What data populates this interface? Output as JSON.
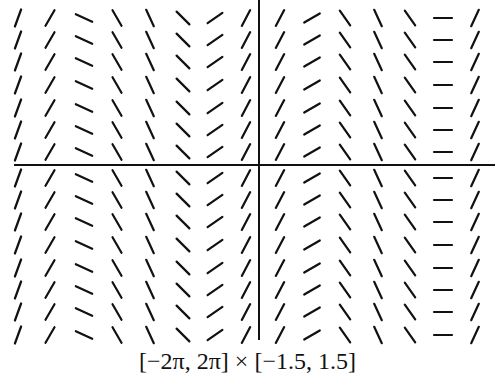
{
  "chart_data": {
    "type": "slope_field",
    "title": "",
    "caption": "[−2π, 2π] × [−1.5, 1.5]",
    "xlim": [
      -6.2832,
      6.2832
    ],
    "ylim": [
      -1.5,
      1.5
    ],
    "xlabel": "",
    "ylabel": "",
    "grid": false,
    "axes": {
      "x_axis_y": 0,
      "y_axis_x": 0
    },
    "note": "Slopes depend only on x (each column identical)",
    "columns_px": [
      18,
      50,
      84,
      117,
      150,
      183,
      215,
      246,
      280,
      312,
      345,
      378,
      410,
      443,
      475
    ],
    "rows_px": [
      18,
      40,
      62,
      85,
      108,
      130,
      152,
      178,
      200,
      222,
      245,
      268,
      290,
      312,
      335
    ],
    "column_slope_angles_deg": [
      70,
      60,
      -25,
      -60,
      -65,
      -45,
      35,
      62,
      62,
      30,
      -55,
      -65,
      -55,
      0,
      65
    ]
  },
  "colors": {
    "ink": "#111111",
    "background": "#ffffff"
  }
}
